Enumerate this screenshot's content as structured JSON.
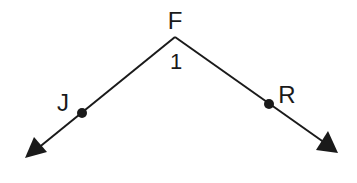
{
  "diagram": {
    "type": "angle",
    "vertex": {
      "label": "F",
      "x": 175,
      "y": 37
    },
    "angle_label": "1",
    "rays": [
      {
        "name": "ray-FJ",
        "point_label": "J",
        "point": {
          "x": 82,
          "y": 113
        },
        "arrow_tip": {
          "x": 25,
          "y": 158
        }
      },
      {
        "name": "ray-FR",
        "point_label": "R",
        "point": {
          "x": 269,
          "y": 104
        },
        "arrow_tip": {
          "x": 338,
          "y": 153
        }
      }
    ],
    "colors": {
      "stroke": "#1a1a1a",
      "background": "#ffffff"
    }
  },
  "labels": {
    "vertex": "F",
    "angle": "1",
    "point_left": "J",
    "point_right": "R"
  }
}
